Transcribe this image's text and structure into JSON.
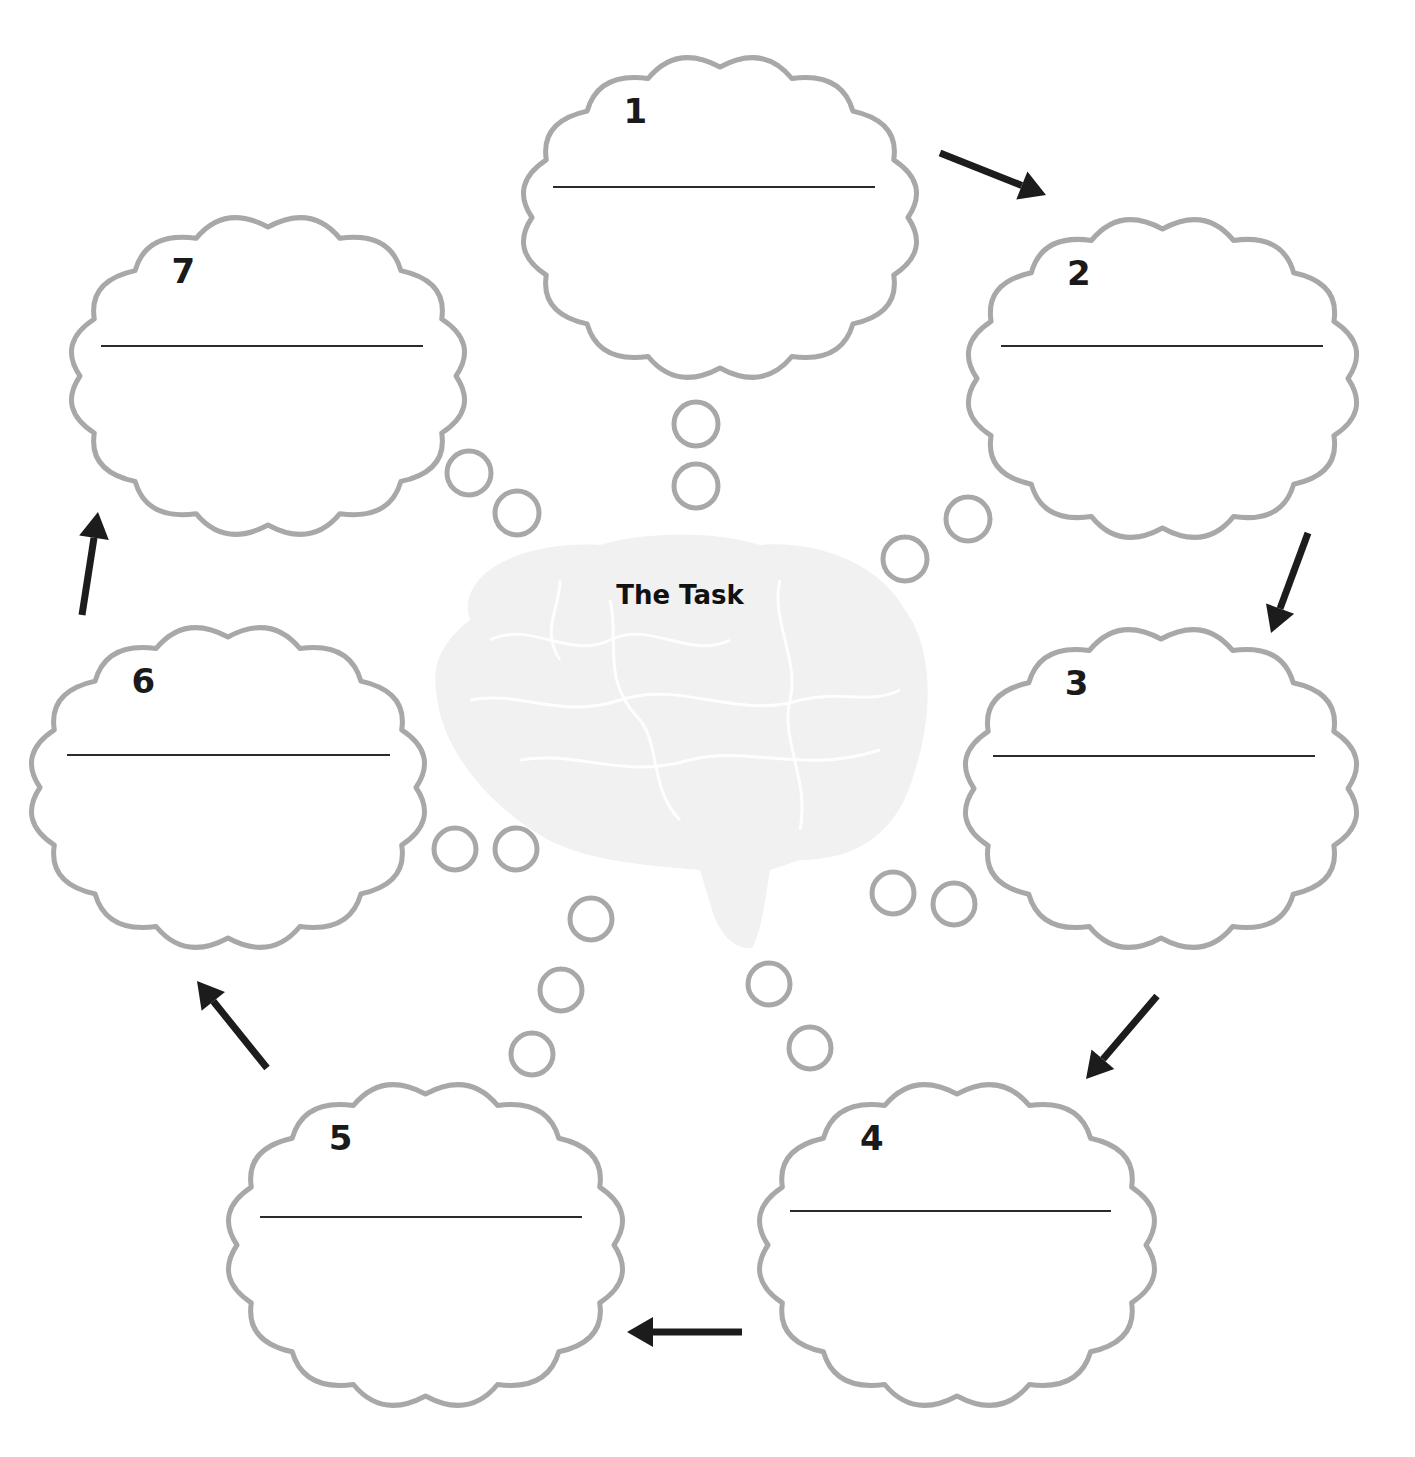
{
  "diagram": {
    "center": {
      "title": "The Task",
      "icon": "brain-icon"
    },
    "steps": [
      {
        "number": "1",
        "x": 510,
        "y": 45,
        "w": 420,
        "h": 345,
        "line_y": 187,
        "line_x1": 553,
        "line_x2": 875
      },
      {
        "number": "2",
        "x": 955,
        "y": 207,
        "w": 415,
        "h": 343,
        "line_y": 346,
        "line_x1": 1001,
        "line_x2": 1323
      },
      {
        "number": "3",
        "x": 952,
        "y": 617,
        "w": 418,
        "h": 343,
        "line_y": 756,
        "line_x1": 993,
        "line_x2": 1315
      },
      {
        "number": "4",
        "x": 746,
        "y": 1072,
        "w": 422,
        "h": 346,
        "line_y": 1211,
        "line_x1": 790,
        "line_x2": 1111
      },
      {
        "number": "5",
        "x": 215,
        "y": 1072,
        "w": 421,
        "h": 346,
        "line_y": 1217,
        "line_x1": 260,
        "line_x2": 582
      },
      {
        "number": "6",
        "x": 18,
        "y": 615,
        "w": 420,
        "h": 345,
        "line_y": 755,
        "line_x1": 67,
        "line_x2": 390
      },
      {
        "number": "7",
        "x": 58,
        "y": 205,
        "w": 420,
        "h": 342,
        "line_y": 346,
        "line_x1": 101,
        "line_x2": 423
      }
    ],
    "bubbles": [
      {
        "cx": 696,
        "cy": 424,
        "r": 22
      },
      {
        "cx": 696,
        "cy": 486,
        "r": 22
      },
      {
        "cx": 968,
        "cy": 519,
        "r": 22
      },
      {
        "cx": 905,
        "cy": 559,
        "r": 22
      },
      {
        "cx": 469,
        "cy": 473,
        "r": 22
      },
      {
        "cx": 517,
        "cy": 513,
        "r": 22
      },
      {
        "cx": 455,
        "cy": 849,
        "r": 21
      },
      {
        "cx": 516,
        "cy": 849,
        "r": 21
      },
      {
        "cx": 893,
        "cy": 893,
        "r": 21
      },
      {
        "cx": 954,
        "cy": 904,
        "r": 21
      },
      {
        "cx": 591,
        "cy": 919,
        "r": 21
      },
      {
        "cx": 561,
        "cy": 990,
        "r": 21
      },
      {
        "cx": 532,
        "cy": 1054,
        "r": 21
      },
      {
        "cx": 769,
        "cy": 984,
        "r": 21
      },
      {
        "cx": 810,
        "cy": 1048,
        "r": 21
      }
    ],
    "arrows": [
      {
        "name": "arrow-1-to-2",
        "x1": 940,
        "y1": 153,
        "x2": 1046,
        "y2": 195
      },
      {
        "name": "arrow-2-to-3",
        "x1": 1308,
        "y1": 533,
        "x2": 1271,
        "y2": 633
      },
      {
        "name": "arrow-3-to-4",
        "x1": 1157,
        "y1": 996,
        "x2": 1086,
        "y2": 1079
      },
      {
        "name": "arrow-4-to-5",
        "x1": 742,
        "y1": 1332,
        "x2": 627,
        "y2": 1332
      },
      {
        "name": "arrow-5-to-6",
        "x1": 267,
        "y1": 1068,
        "x2": 197,
        "y2": 981
      },
      {
        "name": "arrow-6-to-7",
        "x1": 82,
        "y1": 615,
        "x2": 98,
        "y2": 512
      }
    ],
    "colors": {
      "cloud_stroke": "#a8a8a8",
      "arrow": "#1c1c1c",
      "brain": "#f1f1f1",
      "text": "#111111"
    }
  }
}
